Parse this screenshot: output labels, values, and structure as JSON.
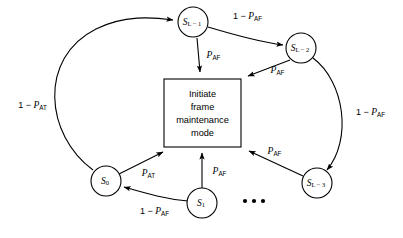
{
  "diagram": {
    "background_color": "#ffffff",
    "line_color": "#000000",
    "center_box": {
      "name": "initiate-frame-maintenance-mode-box",
      "lines": [
        "Initiate",
        "frame",
        "maintenance",
        "mode"
      ],
      "line1": "Initiate",
      "line2": "frame",
      "line3": "maintenance",
      "line4": "mode"
    },
    "nodes": [
      {
        "id": "s_l_minus_1",
        "base": "S",
        "subscript": "L − 1",
        "cx": 193,
        "cy": 22,
        "r": 15
      },
      {
        "id": "s_l_minus_2",
        "base": "S",
        "subscript": "L − 2",
        "cx": 301,
        "cy": 48,
        "r": 15
      },
      {
        "id": "s_l_minus_3",
        "base": "S",
        "subscript": "L − 3",
        "cx": 317,
        "cy": 183,
        "r": 15
      },
      {
        "id": "s_0",
        "base": "S",
        "subscript": "0",
        "cx": 106,
        "cy": 181,
        "r": 15
      },
      {
        "id": "s_1",
        "base": "S",
        "subscript": "1",
        "cx": 202,
        "cy": 203,
        "r": 15
      }
    ],
    "edge_labels": {
      "top_right": {
        "prefix": "1 − ",
        "var": "P",
        "sub": "AF",
        "full": "1 − P_AF"
      },
      "left_arc": {
        "prefix": "1 − ",
        "var": "P",
        "sub": "AT",
        "full": "1 − P_AT"
      },
      "right_arc": {
        "prefix": "1 − ",
        "var": "P",
        "sub": "AF",
        "full": "1 − P_AF"
      },
      "bottom_left": {
        "prefix": "1 − ",
        "var": "P",
        "sub": "AF",
        "full": "1 − P_AF"
      },
      "top_down": {
        "prefix": "",
        "var": "P",
        "sub": "AF",
        "full": "P_AF"
      },
      "upper_right_in": {
        "prefix": "",
        "var": "P",
        "sub": "AF",
        "full": "P_AF"
      },
      "lower_right_in": {
        "prefix": "",
        "var": "P",
        "sub": "AF",
        "full": "P_AF"
      },
      "lower_left_in": {
        "prefix": "",
        "var": "P",
        "sub": "AT",
        "full": "P_AT"
      },
      "bottom_up_in": {
        "prefix": "",
        "var": "P",
        "sub": "AF",
        "full": "P_AF"
      }
    },
    "ellipsis": {
      "name": "ellipsis-dots",
      "text": "• • •",
      "count": 3
    }
  }
}
